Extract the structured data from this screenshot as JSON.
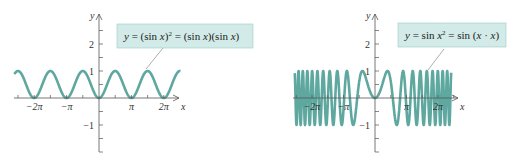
{
  "colors": {
    "curve": "#5fa8a0",
    "axis": "#555555",
    "label_bg": "#d3ebe8",
    "label_border": "#9cc9c3",
    "leader": "#777777"
  },
  "chart_data": [
    {
      "type": "line",
      "title": "y = (sin x)^2 = (sin x)(sin x)",
      "equation_parts": {
        "lhs": "y = (sin x)",
        "sup": "2",
        "rhs": " = (sin x)(sin x)"
      },
      "function": "sin(x)^2",
      "xlabel": "x",
      "ylabel": "y",
      "x_range": [
        -8.2,
        7.9
      ],
      "ylim": [
        -2.5,
        3
      ],
      "x_ticks": [
        {
          "value": -6.2832,
          "label": "−2π"
        },
        {
          "value": -3.1416,
          "label": "−π"
        },
        {
          "value": 3.1416,
          "label": "π"
        },
        {
          "value": 6.2832,
          "label": "2π"
        }
      ],
      "y_ticks": [
        {
          "value": 2,
          "label": "2"
        },
        {
          "value": 1,
          "label": "1"
        },
        {
          "value": -1,
          "label": "−1"
        }
      ],
      "grid": false,
      "legend": "callout"
    },
    {
      "type": "line",
      "title": "y = sin x^2 = sin (x · x)",
      "equation_parts": {
        "lhs": "y = sin x",
        "sup": "2",
        "rhs": " = sin (x · x)"
      },
      "function": "sin(x^2)",
      "xlabel": "x",
      "ylabel": "y",
      "x_range": [
        -8.0,
        7.6
      ],
      "ylim": [
        -2.5,
        3
      ],
      "x_ticks": [
        {
          "value": -6.2832,
          "label": "−2π"
        },
        {
          "value": -3.1416,
          "label": "−π"
        },
        {
          "value": 3.1416,
          "label": "π"
        },
        {
          "value": 6.2832,
          "label": "2π"
        }
      ],
      "y_ticks": [
        {
          "value": 2,
          "label": "2"
        },
        {
          "value": 1,
          "label": "1"
        },
        {
          "value": -1,
          "label": "−1"
        }
      ],
      "grid": false,
      "legend": "callout"
    }
  ],
  "axis_labels": {
    "x": "x",
    "y": "y"
  }
}
